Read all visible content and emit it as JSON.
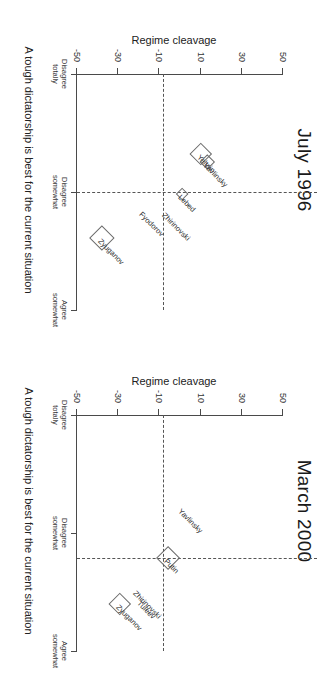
{
  "figure": {
    "orientation_deg": 90,
    "panels": [
      {
        "key": "left",
        "title": "July 1996",
        "xlabel": "A tough dictatorship is best for the current situation",
        "ylabel": "Regime cleavage"
      },
      {
        "key": "right",
        "title": "March 2000",
        "xlabel": "A tough dictatorship is best for the current situation",
        "ylabel": "Regime cleavage"
      }
    ]
  },
  "chart_data": [
    {
      "type": "scatter",
      "title": "July 1996",
      "xlabel": "A tough dictatorship is best for the current situation",
      "ylabel": "Regime cleavage",
      "xlim": [
        0,
        3
      ],
      "ylim": [
        -50,
        50
      ],
      "xticks": [
        0,
        1.5,
        3
      ],
      "xticklabels": [
        "Disagree totally",
        "Disagree somewhat",
        "Agree somewhat"
      ],
      "yticks": [
        50,
        30,
        10,
        -10,
        -30,
        -50
      ],
      "yticklabels": [
        "50",
        "30",
        "10",
        "-10",
        "-30",
        "-50"
      ],
      "grid": false,
      "reference_lines": {
        "horizontal_y": -8,
        "vertical_x": 1.5
      },
      "points": [
        {
          "name": "Yeltsin",
          "x": 1.02,
          "y": 10,
          "marker": "diamond",
          "size": 19
        },
        {
          "name": "Yavlinsky",
          "x": 1.12,
          "y": 13,
          "marker": "diamond",
          "size": 13
        },
        {
          "name": "Lebed",
          "x": 1.52,
          "y": 1,
          "marker": "diamond",
          "size": 10
        },
        {
          "name": "Zhirinovski",
          "x": 1.76,
          "y": -7,
          "marker": "none",
          "size": 0
        },
        {
          "name": "Fyodorov",
          "x": 1.74,
          "y": -18,
          "marker": "none",
          "size": 0
        },
        {
          "name": "Zyuganov",
          "x": 2.08,
          "y": -38,
          "marker": "diamond",
          "size": 22
        }
      ]
    },
    {
      "type": "scatter",
      "title": "March 2000",
      "xlabel": "A tough dictatorship is best for the current situation",
      "ylabel": "Regime cleavage",
      "xlim": [
        0,
        3
      ],
      "ylim": [
        -50,
        50
      ],
      "xticks": [
        0,
        1.5,
        3
      ],
      "xticklabels": [
        "Disagree totally",
        "Disagree somewhat",
        "Agree somewhat"
      ],
      "yticks": [
        50,
        30,
        10,
        -10,
        -30,
        -50
      ],
      "yticklabels": [
        "50",
        "30",
        "10",
        "-10",
        "-30",
        "-50"
      ],
      "grid": false,
      "reference_lines": {
        "horizontal_y": -8,
        "vertical_x": 1.82
      },
      "points": [
        {
          "name": "Putin",
          "x": 1.82,
          "y": -6,
          "marker": "diamond",
          "size": 21
        },
        {
          "name": "Yavlinsky",
          "x": 1.18,
          "y": 1,
          "marker": "none",
          "size": 0
        },
        {
          "name": "Zhirinovski",
          "x": 2.22,
          "y": -21,
          "marker": "none",
          "size": 0
        },
        {
          "name": "Tuleev",
          "x": 2.35,
          "y": -19,
          "marker": "none",
          "size": 0
        },
        {
          "name": "Zyuganov",
          "x": 2.4,
          "y": -29,
          "marker": "diamond",
          "size": 19
        }
      ]
    }
  ],
  "colors": {
    "axis": "#4a4a4a",
    "text": "#2b2b2b",
    "marker_stroke": "#6b6b6b",
    "dashed": "#555555",
    "background": "#ffffff"
  }
}
